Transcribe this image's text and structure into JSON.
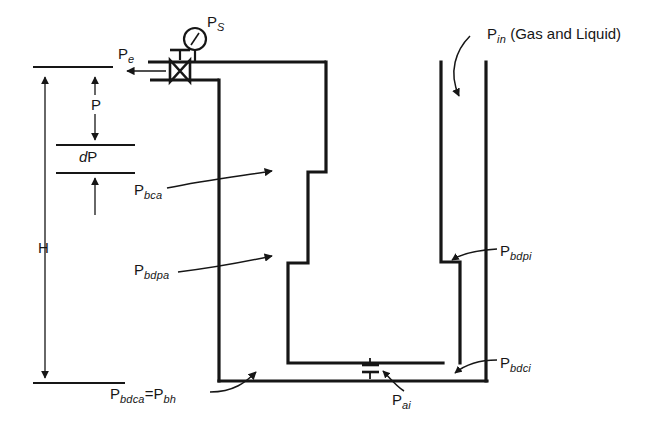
{
  "figure": {
    "type": "engineering-schematic",
    "background_color": "#ffffff",
    "line_color": "#161616",
    "text_color": "#161616"
  },
  "labels": [
    {
      "id": "p-s",
      "base": "P",
      "sub": "S",
      "suffix": "",
      "x": 207,
      "y": 14,
      "name": "label-ps"
    },
    {
      "id": "p-e",
      "base": "P",
      "sub": "e",
      "suffix": "",
      "x": 118,
      "y": 46,
      "name": "label-pe"
    },
    {
      "id": "p-in",
      "base": "P",
      "sub": "in",
      "suffix": " (Gas and Liquid)",
      "x": 487,
      "y": 26,
      "name": "label-pin"
    },
    {
      "id": "p-bca",
      "base": "P",
      "sub": "bca",
      "suffix": "",
      "x": 134,
      "y": 182,
      "name": "label-pbca"
    },
    {
      "id": "p-bdpa",
      "base": "P",
      "sub": "bdpa",
      "suffix": "",
      "x": 134,
      "y": 262,
      "name": "label-pbdpa"
    },
    {
      "id": "p-bdpi",
      "base": "P",
      "sub": "bdpi",
      "suffix": "",
      "x": 500,
      "y": 243,
      "name": "label-pbdpi"
    },
    {
      "id": "p-bdci",
      "base": "P",
      "sub": "bdci",
      "suffix": "",
      "x": 500,
      "y": 355,
      "name": "label-pbdci"
    },
    {
      "id": "p-ai",
      "base": "P",
      "sub": "ai",
      "suffix": "",
      "x": 392,
      "y": 392,
      "name": "label-pai"
    }
  ],
  "equation_label": {
    "name": "label-pbdca-eq-pbh",
    "x": 110,
    "y": 386,
    "left_base": "P",
    "left_sub": "bdca",
    "operator": "=",
    "right_base": "P",
    "right_sub": "bh"
  },
  "dimension_labels": {
    "p": {
      "text": "P",
      "x": 91,
      "y": 105,
      "name": "dimension-label-p"
    },
    "dp": {
      "italic_part": "d",
      "plain_part": "P",
      "x": 79,
      "y": 150,
      "name": "dimension-label-dp"
    },
    "h": {
      "text": "H",
      "x": 38,
      "y": 240,
      "name": "dimension-label-h"
    }
  },
  "components": {
    "pressure_gauge": {
      "name": "pressure-gauge-icon",
      "cx": 195,
      "cy": 39,
      "r": 11
    },
    "valve": {
      "name": "valve-icon",
      "cx": 180,
      "cy": 71
    },
    "gas_lift_valve": {
      "name": "gas-lift-valve-icon",
      "cx": 370,
      "cy": 369
    },
    "casing_left_wall": {
      "name": "casing-left-wall"
    },
    "casing_right_wall": {
      "name": "casing-right-wall"
    },
    "tubing_string": {
      "name": "tubing-string"
    },
    "wellhead_line": {
      "name": "wellhead-flowline"
    }
  },
  "callout_arrows": [
    {
      "name": "arrow-pe-flow",
      "from": "wellhead",
      "to": "left"
    },
    {
      "name": "arrow-pin-inflow",
      "from": "label-pin",
      "to": "tubing-annulus"
    },
    {
      "name": "arrow-pbca-callout",
      "from": "label-pbca",
      "to": "casing-left-wall"
    },
    {
      "name": "arrow-pbdpa-callout",
      "from": "label-pbdpa",
      "to": "casing-left-wall"
    },
    {
      "name": "arrow-pbdpi-callout",
      "from": "label-pbdpi",
      "to": "tubing-step"
    },
    {
      "name": "arrow-pbdci-callout",
      "from": "label-pbdci",
      "to": "casing-bottom"
    },
    {
      "name": "arrow-pai-callout",
      "from": "label-pai",
      "to": "gas-lift-valve"
    },
    {
      "name": "arrow-pbdca-callout",
      "from": "equation-label",
      "to": "casing-bottom-left"
    }
  ],
  "dimension_lines": {
    "h": {
      "name": "dimension-line-h",
      "top_y": 67,
      "bottom_y": 383,
      "x": 45
    },
    "p": {
      "name": "dimension-line-p",
      "top_y": 67,
      "bottom_y": 145,
      "x": 95
    },
    "dp": {
      "name": "dimension-line-dp",
      "top_y": 145,
      "bottom_y": 173,
      "x": 95
    }
  }
}
